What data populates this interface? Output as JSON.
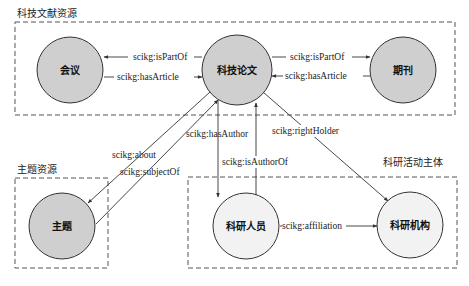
{
  "diagram": {
    "groups": [
      {
        "id": "literature",
        "label": "科技文献资源"
      },
      {
        "id": "topic",
        "label": "主题资源"
      },
      {
        "id": "actors",
        "label": "科研活动主体"
      }
    ],
    "nodes": [
      {
        "id": "conference",
        "label": "会议",
        "group": "literature"
      },
      {
        "id": "paper",
        "label": "科技论文",
        "group": "literature"
      },
      {
        "id": "journal",
        "label": "期刊",
        "group": "literature"
      },
      {
        "id": "subject",
        "label": "主题",
        "group": "topic"
      },
      {
        "id": "researcher",
        "label": "科研人员",
        "group": "actors"
      },
      {
        "id": "institution",
        "label": "科研机构",
        "group": "actors"
      }
    ],
    "edges": [
      {
        "from": "paper",
        "to": "conference",
        "label": "scikg:isPartOf"
      },
      {
        "from": "conference",
        "to": "paper",
        "label": "scikg:hasArticle"
      },
      {
        "from": "paper",
        "to": "journal",
        "label": "scikg:isPartOf"
      },
      {
        "from": "journal",
        "to": "paper",
        "label": "scikg:hasArticle"
      },
      {
        "from": "paper",
        "to": "subject",
        "label": "scikg:about"
      },
      {
        "from": "subject",
        "to": "paper",
        "label": "scikg:subjectOf"
      },
      {
        "from": "paper",
        "to": "researcher",
        "label": "scikg:hasAuthor"
      },
      {
        "from": "researcher",
        "to": "paper",
        "label": "scikg:isAuthorOf"
      },
      {
        "from": "paper",
        "to": "institution",
        "label": "scikg:rightHolder"
      },
      {
        "from": "researcher",
        "to": "institution",
        "label": "scikg:affiliation"
      }
    ],
    "colors": {
      "node_fill_shaded": "#cfcfcf",
      "node_fill_plain": "#f2f2f2",
      "stroke": "#333333",
      "box_stroke": "#555555"
    }
  }
}
